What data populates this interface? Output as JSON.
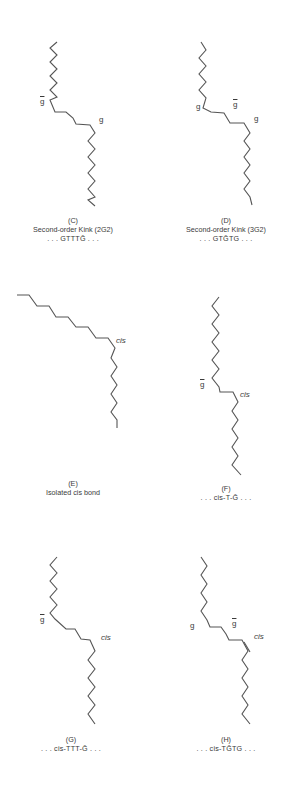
{
  "figure": {
    "panels": [
      {
        "id": "C",
        "letter": "(C)",
        "title": "Second-order Kink (2G2)",
        "sequence": ". . . GTTTḠ . . .",
        "labels": [
          {
            "text": "g",
            "overline": true,
            "x": 40,
            "y": 103
          },
          {
            "text": "g",
            "overline": false,
            "x": 99,
            "y": 121
          }
        ],
        "chain": "57,42 50,48 57,55 50,62 57,69 50,76 57,83 50,90 57,97 50,100 55,112 66,112 73,118 76,124 90,125 95,133 88,141 95,149 88,157 95,165 88,173 95,181 88,189 95,197 88,200 95,206"
      },
      {
        "id": "D",
        "letter": "(D)",
        "title": "Second-order Kink (3G2)",
        "sequence": ". . . GTḠTG . . .",
        "labels": [
          {
            "text": "g",
            "overline": false,
            "x": 196,
            "y": 108
          },
          {
            "text": "g",
            "overline": true,
            "x": 233,
            "y": 106
          },
          {
            "text": "g",
            "overline": false,
            "x": 254,
            "y": 120
          }
        ],
        "chain": "201,42 206,50 199,58 206,66 199,74 206,82 199,90 206,98 203,108 211,112 224,113 230,123 244,123 250,133 244,141 250,149 244,157 250,165 244,173 250,181 244,189 250,197 252,205"
      },
      {
        "id": "E",
        "letter": "(E)",
        "title": "Isolated cis bond",
        "title_italic_word": "cis",
        "sequence": "",
        "labels": [
          {
            "text": "cis",
            "overline": false,
            "italic": true,
            "x": 116,
            "y": 342
          }
        ],
        "chain": "17,295 29,295 37,306 49,306 56,317 68,317 76,327 88,327 96,338 108,338 115,348 111,358 117,367 111,376 117,385 111,394 117,403 111,412 117,420 117,428"
      },
      {
        "id": "F",
        "letter": "(F)",
        "title": "",
        "sequence": ". . . cis-T-Ḡ . . .",
        "labels": [
          {
            "text": "g",
            "overline": true,
            "x": 200,
            "y": 386
          },
          {
            "text": "cis",
            "overline": false,
            "italic": true,
            "x": 240,
            "y": 396
          }
        ],
        "chain": "219,297 212,306 219,315 212,324 219,333 212,342 219,351 212,360 219,369 212,378 219,387 220,392 233,392 238,402 232,411 238,420 232,429 238,438 232,447 238,456 232,465 241,475"
      },
      {
        "id": "G",
        "letter": "(G)",
        "title": "",
        "sequence": ". . . cis-TTT-Ḡ . . .",
        "labels": [
          {
            "text": "g",
            "overline": true,
            "x": 40,
            "y": 621
          },
          {
            "text": "cis",
            "overline": false,
            "italic": true,
            "x": 101,
            "y": 639
          }
        ],
        "chain": "57,557 50,565 57,573 50,581 57,589 50,597 57,605 50,613 55,619 66,629 75,629 81,639 90,640 95,651 88,660 95,669 88,678 95,687 88,696 95,705 88,714 95,724"
      },
      {
        "id": "H",
        "letter": "(H)",
        "title": "",
        "sequence": ". . . cis-TḠTG . . .",
        "labels": [
          {
            "text": "g",
            "overline": false,
            "x": 190,
            "y": 627
          },
          {
            "text": "g",
            "overline": true,
            "x": 232,
            "y": 625
          },
          {
            "text": "cis",
            "overline": false,
            "italic": true,
            "x": 254,
            "y": 638
          }
        ],
        "chain": "201,557 207,566 201,575 207,584 201,593 207,602 201,611 207,620 210,627 221,627 226,634 229,640 242,640 248,651 242,660 248,669 242,678 248,687 242,696 248,705 242,714 250,724",
        "double_bond": {
          "x1": 244,
          "y1": 642,
          "x2": 250,
          "y2": 652
        }
      }
    ]
  }
}
